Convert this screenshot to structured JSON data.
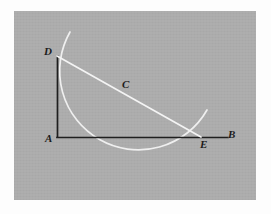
{
  "figure": {
    "background_color": "#adadad",
    "page_color": "#fdfdfd",
    "line_color_dark": "#1b1b1b",
    "line_color_light": "#f2f2f2",
    "label_color": "#1b1b1b"
  },
  "labels": {
    "D": "D",
    "A": "A",
    "B": "B",
    "E": "E",
    "C": "C"
  },
  "points": {
    "D": {
      "x": 57,
      "y": 57
    },
    "A": {
      "x": 57,
      "y": 137
    },
    "E": {
      "x": 200,
      "y": 137
    },
    "B": {
      "x": 228,
      "y": 137
    }
  },
  "segments": [
    {
      "name": "segment-AD",
      "from": "A",
      "to": "D",
      "color": "#1b1b1b",
      "width": 1.6
    },
    {
      "name": "segment-AB",
      "from": "A",
      "to": "B",
      "color": "#1b1b1b",
      "width": 1.6
    },
    {
      "name": "segment-DE",
      "from": "D",
      "to": "E",
      "color": "#f2f2f2",
      "width": 1.6,
      "label": "C"
    }
  ],
  "arc": {
    "name": "construction-arc",
    "color": "#f2f2f2",
    "width": 1.6,
    "center": {
      "x": 129,
      "y": 110
    },
    "radius": 73,
    "start_point": {
      "x": 70,
      "y": 32
    },
    "end_point": {
      "x": 207,
      "y": 110
    },
    "lowest_point": {
      "x": 140,
      "y": 183
    }
  }
}
